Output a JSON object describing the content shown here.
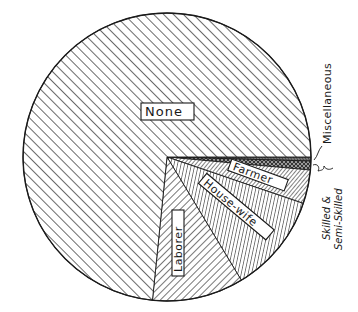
{
  "chart_data": {
    "type": "pie",
    "title": "",
    "center": [
      167,
      157
    ],
    "radius": 144,
    "start_angle_deg": 0,
    "direction": "clockwise",
    "slices": [
      {
        "label": "Miscellaneous",
        "value": 0.5,
        "start_deg": 0.0,
        "end_deg": 1.6,
        "pattern": "fine-diagonal",
        "label_position": "outside-leader"
      },
      {
        "label": "Skilled & Semi-Skilled",
        "value": 1.0,
        "start_deg": 1.6,
        "end_deg": 5.2,
        "pattern": "herringbone",
        "label_position": "outside-brace"
      },
      {
        "label": "Farmer",
        "value": 3.8,
        "start_deg": 5.2,
        "end_deg": 18.8,
        "pattern": "dense-backslash",
        "label_position": "inside"
      },
      {
        "label": "House-wife",
        "value": 11.1,
        "start_deg": 18.8,
        "end_deg": 58.9,
        "pattern": "vertical-lines",
        "label_position": "inside"
      },
      {
        "label": "Laborer",
        "value": 10.3,
        "start_deg": 58.9,
        "end_deg": 95.8,
        "pattern": "backslash",
        "label_position": "inside"
      },
      {
        "label": "None",
        "value": 73.3,
        "start_deg": 95.8,
        "end_deg": 360.0,
        "pattern": "forward-slash",
        "label_position": "inside"
      }
    ],
    "categories": [
      "Miscellaneous",
      "Skilled & Semi-Skilled",
      "Farmer",
      "House-wife",
      "Laborer",
      "None"
    ],
    "values": [
      0.5,
      1.0,
      3.8,
      11.1,
      10.3,
      73.3
    ],
    "units": "percent (estimated from angles)",
    "legend": "none (labels drawn on slices)"
  },
  "labels": {
    "none": "None",
    "laborer": "Laborer",
    "housewife": "House-wife",
    "farmer": "Farmer",
    "misc": "Miscellaneous",
    "skilled_line1": "Skilled &",
    "skilled_line2": "Semi-Skilled"
  },
  "colors": {
    "ink": "#1a1a1a",
    "paper": "#ffffff"
  }
}
